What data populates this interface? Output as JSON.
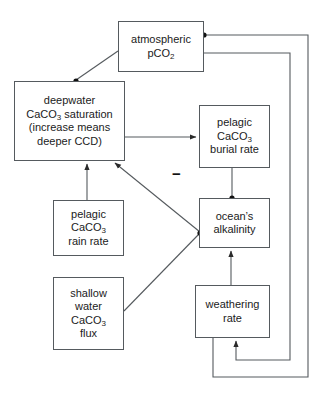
{
  "diagram": {
    "type": "flow-diagram",
    "width": 324,
    "height": 393,
    "background_color": "#ffffff",
    "line_color": "#555a5e",
    "text_color": "#1b1b1b",
    "nodes": [
      {
        "id": "atmospheric-pco2",
        "lines": [
          "atmospheric",
          "pCO",
          "2"
        ],
        "line1": "atmospheric",
        "line2_main": "pCO",
        "line2_sub": "2",
        "x": 118,
        "y": 21,
        "w": 86,
        "h": 51
      },
      {
        "id": "deepwater-caco3-saturation",
        "line1": "deepwater",
        "line2_a": "CaCO",
        "line2_sub": "3",
        "line2_b": " saturation",
        "line3": "(increase means",
        "line4": "deeper CCD)",
        "x": 14,
        "y": 81,
        "w": 111,
        "h": 80
      },
      {
        "id": "pelagic-caco3-burial-rate",
        "line1": "pelagic",
        "line2_a": "CaCO",
        "line2_sub": "3",
        "line3": "burial rate",
        "x": 199,
        "y": 105,
        "w": 71,
        "h": 63
      },
      {
        "id": "pelagic-caco3-rain-rate",
        "line1": "pelagic",
        "line2_a": "CaCO",
        "line2_sub": "3",
        "line3": "rain rate",
        "x": 53,
        "y": 200,
        "w": 71,
        "h": 56
      },
      {
        "id": "oceans-alkalinity",
        "line1": "ocean’s",
        "line2": "alkalinity",
        "x": 199,
        "y": 198,
        "w": 71,
        "h": 50
      },
      {
        "id": "shallow-water-caco3-flux",
        "line1": "shallow",
        "line2": "water",
        "line3_a": "CaCO",
        "line3_sub": "3",
        "line4": "flux",
        "x": 53,
        "y": 277,
        "w": 71,
        "h": 73
      },
      {
        "id": "weathering-rate",
        "line1": "weathering",
        "line2": "rate",
        "x": 195,
        "y": 285,
        "w": 75,
        "h": 53
      }
    ],
    "annotations": [
      {
        "id": "negative-sign",
        "label": "−",
        "x": 172,
        "y": 166,
        "meaning": "negative feedback on link from ocean's alkalinity to deepwater CaCO3 saturation"
      }
    ],
    "edges": [
      {
        "id": "atmospheric-to-deepwater",
        "from": "atmospheric-pco2",
        "to": "deepwater-caco3-saturation",
        "style": "diagonal",
        "terminal": "dot"
      },
      {
        "id": "deepwater-to-burial",
        "from": "deepwater-caco3-saturation",
        "to": "pelagic-caco3-burial-rate",
        "style": "straight",
        "terminal": "arrow"
      },
      {
        "id": "burial-to-alkalinity",
        "from": "pelagic-caco3-burial-rate",
        "to": "oceans-alkalinity",
        "style": "straight",
        "terminal": "dot"
      },
      {
        "id": "alkalinity-to-deepwater",
        "from": "oceans-alkalinity",
        "to": "deepwater-caco3-saturation",
        "style": "diagonal",
        "terminal": "arrow",
        "sign": "−"
      },
      {
        "id": "rain-rate-to-deepwater",
        "from": "pelagic-caco3-rain-rate",
        "to": "deepwater-caco3-saturation",
        "style": "straight",
        "terminal": "arrow"
      },
      {
        "id": "shallow-flux-to-alkalinity",
        "from": "shallow-water-caco3-flux",
        "to": "oceans-alkalinity",
        "style": "diagonal",
        "terminal": "dot"
      },
      {
        "id": "weathering-to-alkalinity",
        "from": "weathering-rate",
        "to": "oceans-alkalinity",
        "style": "straight",
        "terminal": "arrow"
      },
      {
        "id": "atmospheric-to-weathering-feedback",
        "from": "atmospheric-pco2",
        "to": "weathering-rate",
        "style": "orthogonal-loop",
        "terminal": "arrow"
      },
      {
        "id": "burial-feedback-to-atmospheric",
        "from": "pelagic-caco3-burial-rate",
        "to": "atmospheric-pco2",
        "style": "orthogonal-loop",
        "terminal": "dot"
      }
    ]
  }
}
